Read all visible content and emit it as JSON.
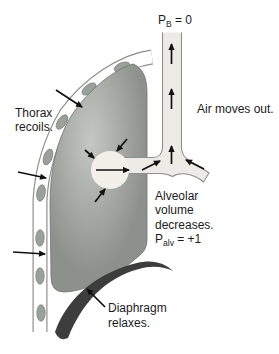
{
  "figure": {
    "labels": {
      "pb": {
        "base": "P",
        "sub": "B",
        "rest": " = 0"
      },
      "air": "Air moves out.",
      "thorax": [
        "Thorax",
        "recoils."
      ],
      "alveolar": [
        "Alveolar",
        "volume",
        "decreases."
      ],
      "palv": {
        "base": "P",
        "sub": "alv",
        "rest": " = +1"
      },
      "diaphragm": [
        "Diaphragm",
        "relaxes."
      ]
    },
    "colors": {
      "background": "#ffffff",
      "airway_fill": "#edebe5",
      "airway_outline": "#8f8f8c",
      "alveolus_fill": "#f2f0e9",
      "lung_light": "#c5c8c2",
      "lung_dark": "#8d918c",
      "lung_outline": "#70746f",
      "wall_outline": "#8f8f8c",
      "wall_fill": "#ffffff",
      "rib_fill": "#9aa09a",
      "rib_outline": "#767c76",
      "diaphragm": "#3d3d3d",
      "arrow": "#111111",
      "text": "#1b1b1b"
    }
  }
}
